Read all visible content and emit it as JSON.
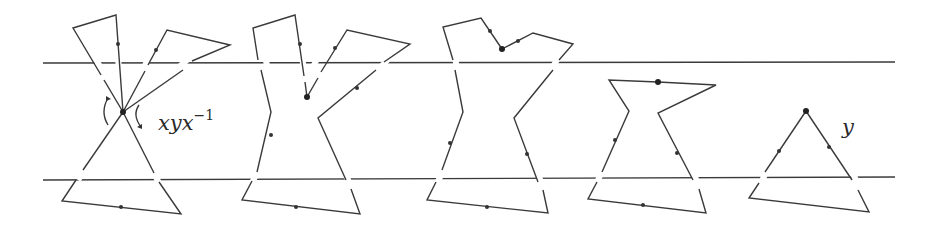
{
  "diagram": {
    "labels": {
      "first": {
        "base": "xyx",
        "exponent": "−1"
      },
      "last": "y"
    },
    "strip": {
      "top_line": {
        "x1": 43,
        "y1": 63,
        "x2": 895,
        "y2": 62
      },
      "bottom_line": {
        "x1": 43,
        "y1": 180,
        "x2": 895,
        "y2": 177
      }
    },
    "stages": [
      {
        "name": "stage-1",
        "basepoint": [
          123,
          112
        ],
        "paths": [
          "M123,112 L116,15 L73,28 L123,112",
          "M123,112 L167,30 L230,45 L123,112",
          "M123,112 L62,201 L181,214 L123,112"
        ]
      },
      {
        "name": "stage-2",
        "basepoint": [
          307,
          97
        ],
        "paths": [
          "M307,97 L347,30 L410,44 L318,118 L360,214 L242,200 L271,112 L253,28 L295,15 L307,97"
        ]
      },
      {
        "name": "stage-3",
        "basepoint": [
          502,
          49
        ],
        "paths": [
          "M502,49 L533,33 L573,44 L514,118 L548,213 L427,200 L463,112 L443,27 L481,18 L502,49"
        ]
      },
      {
        "name": "stage-4",
        "basepoint": [
          658,
          82
        ],
        "paths": [
          "M658,82 L716,85 L658,113 L706,213 L588,199 L629,111 L609,80 L658,82"
        ]
      },
      {
        "name": "stage-5",
        "basepoint": [
          806,
          111
        ],
        "paths": [
          "M806,111 L869,212 L749,198 L806,111"
        ]
      }
    ]
  }
}
